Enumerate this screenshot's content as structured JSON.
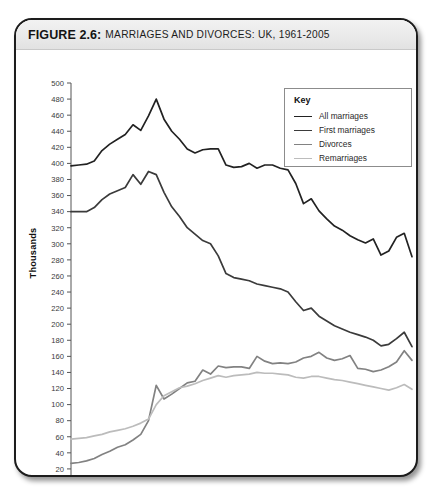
{
  "figure": {
    "label": "FIGURE 2.6:",
    "title": "MARRIAGES AND DIVORCES: UK, 1961-2005"
  },
  "key": {
    "title": "Key",
    "items": [
      {
        "label": "All marriages",
        "color": "#222222"
      },
      {
        "label": "First marriages",
        "color": "#3b3b3b"
      },
      {
        "label": "Divorces",
        "color": "#828282"
      },
      {
        "label": "Remarriages",
        "color": "#bcbcbc"
      }
    ]
  },
  "chart_data": {
    "type": "line",
    "title": "MARRIAGES AND DIVORCES: UK, 1961-2005",
    "xlabel": "",
    "ylabel": "Thousands",
    "xlim": [
      1961,
      2005
    ],
    "ylim": [
      0,
      500
    ],
    "ytick_step": 20,
    "yticks": [
      20,
      40,
      60,
      80,
      100,
      120,
      140,
      160,
      180,
      200,
      220,
      240,
      260,
      280,
      300,
      320,
      340,
      360,
      380,
      400,
      420,
      440,
      460,
      480,
      500
    ],
    "xticks": [
      1965,
      1970,
      1975,
      1980,
      1985,
      1990,
      1995,
      2000,
      2005
    ],
    "x_minor_tick_step": 1,
    "grid": false,
    "legend_position": "top-right",
    "x": [
      1961,
      1962,
      1963,
      1964,
      1965,
      1966,
      1967,
      1968,
      1969,
      1970,
      1971,
      1972,
      1973,
      1974,
      1975,
      1976,
      1977,
      1978,
      1979,
      1980,
      1981,
      1982,
      1983,
      1984,
      1985,
      1986,
      1987,
      1988,
      1989,
      1990,
      1991,
      1992,
      1993,
      1994,
      1995,
      1996,
      1997,
      1998,
      1999,
      2000,
      2001,
      2002,
      2003,
      2004,
      2005
    ],
    "series": [
      {
        "name": "All marriages",
        "color": "#222222",
        "values": [
          397,
          398,
          399,
          403,
          416,
          424,
          430,
          436,
          448,
          441,
          459,
          480,
          455,
          440,
          430,
          418,
          413,
          417,
          418,
          418,
          398,
          395,
          396,
          400,
          394,
          398,
          398,
          394,
          392,
          375,
          350,
          356,
          341,
          331,
          322,
          317,
          310,
          305,
          301,
          306,
          286,
          291,
          308,
          313,
          284
        ],
        "note": "Peaks at ~480 thousand in 1972; declines to ~284 thousand by 2005"
      },
      {
        "name": "First marriages",
        "color": "#3b3b3b",
        "values": [
          340,
          340,
          340,
          345,
          355,
          362,
          366,
          370,
          386,
          374,
          390,
          386,
          364,
          346,
          334,
          320,
          312,
          304,
          300,
          285,
          263,
          258,
          256,
          254,
          250,
          248,
          246,
          244,
          240,
          228,
          217,
          220,
          210,
          204,
          198,
          194,
          190,
          187,
          184,
          180,
          173,
          175,
          182,
          190,
          172
        ],
        "note": "Peaks at ~390 thousand in 1971; falls to ~172 thousand in 2005"
      },
      {
        "name": "Divorces",
        "color": "#828282",
        "values": [
          27,
          28,
          30,
          33,
          38,
          42,
          47,
          50,
          56,
          63,
          80,
          124,
          107,
          113,
          120,
          127,
          129,
          143,
          138,
          148,
          146,
          147,
          147,
          145,
          160,
          154,
          151,
          152,
          151,
          153,
          158,
          160,
          165,
          158,
          155,
          157,
          161,
          145,
          144,
          141,
          143,
          147,
          153,
          167,
          155
        ],
        "note": "Sharp rise after the 1969 Divorce Reform Act; peak ~180 thousand early 1990s"
      },
      {
        "name": "Remarriages",
        "color": "#bcbcbc",
        "values": [
          57,
          58,
          59,
          61,
          63,
          66,
          68,
          70,
          73,
          77,
          82,
          100,
          111,
          116,
          121,
          123,
          126,
          130,
          133,
          136,
          134,
          136,
          137,
          138,
          140,
          139,
          139,
          138,
          137,
          134,
          133,
          135,
          135,
          133,
          131,
          130,
          128,
          126,
          124,
          122,
          120,
          118,
          121,
          125,
          119
        ],
        "note": "Rises steeply to ~140 thousand by mid-1980s, then gently declines"
      }
    ]
  }
}
